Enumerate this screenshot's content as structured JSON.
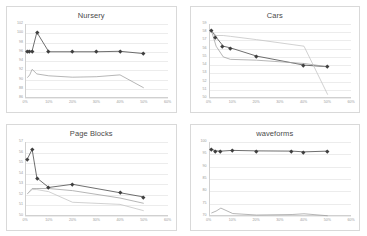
{
  "figure": {
    "layout": "2x2-grid",
    "background": "#ffffff",
    "panel_border_color": "#d9d9d9",
    "gridline_color": "#ececec",
    "tick_label_color": "#9a9a9a",
    "title_color": "#4a4a4a"
  },
  "chart_data": [
    {
      "type": "line",
      "title": "Nursery",
      "xlabel": "",
      "ylabel": "",
      "grid": true,
      "legend": "none",
      "xlim": [
        0,
        60
      ],
      "ylim": [
        86,
        102
      ],
      "yticks": [
        86,
        88,
        90,
        92,
        94,
        96,
        98,
        100,
        102
      ],
      "ytick_labels": [
        "86",
        "88",
        "90",
        "92",
        "94",
        "96",
        "98",
        "100",
        "102"
      ],
      "xticks": [
        0,
        10,
        20,
        30,
        40,
        50,
        60
      ],
      "xtick_labels": [
        "0%",
        "10%",
        "20%",
        "30%",
        "40%",
        "50%",
        "60%"
      ],
      "series": [
        {
          "name": "series-1-dark-markers",
          "color": "#3f3f3f",
          "marker": "diamond",
          "x": [
            1,
            2,
            3,
            5,
            10,
            20,
            30,
            40,
            50
          ],
          "values": [
            96.1,
            96.1,
            96.2,
            100.2,
            96.0,
            96.0,
            96.0,
            96.1,
            95.6
          ]
        },
        {
          "name": "series-2-gray",
          "color": "#9e9e9e",
          "marker": "none",
          "x": [
            1,
            2,
            3,
            5,
            10,
            20,
            30,
            40,
            50
          ],
          "values": [
            90.4,
            91.0,
            92.2,
            91.2,
            90.8,
            90.5,
            90.6,
            91.0,
            88.2
          ]
        }
      ]
    },
    {
      "type": "line",
      "title": "Cars",
      "xlabel": "",
      "ylabel": "",
      "grid": true,
      "legend": "none",
      "xlim": [
        0,
        60
      ],
      "ylim": [
        50,
        59
      ],
      "yticks": [
        50,
        51,
        52,
        53,
        54,
        55,
        56,
        57,
        58,
        59
      ],
      "ytick_labels": [
        "50",
        "51",
        "52",
        "53",
        "54",
        "55",
        "56",
        "57",
        "58",
        "59"
      ],
      "xticks": [
        0,
        10,
        20,
        30,
        40,
        50,
        60
      ],
      "xtick_labels": [
        "0%",
        "10%",
        "20%",
        "30%",
        "40%",
        "50%",
        "60%"
      ],
      "series": [
        {
          "name": "series-1-dark-markers",
          "color": "#3f3f3f",
          "marker": "diamond",
          "x": [
            1,
            3,
            6,
            9,
            20,
            40,
            50
          ],
          "values": [
            58.2,
            57.4,
            56.3,
            56.1,
            55.1,
            54.0,
            53.8
          ]
        },
        {
          "name": "series-2-gray",
          "color": "#9e9e9e",
          "marker": "none",
          "x": [
            1,
            3,
            6,
            9,
            20,
            40,
            50
          ],
          "values": [
            58.2,
            56.3,
            55.0,
            54.7,
            54.6,
            54.2,
            53.8
          ]
        },
        {
          "name": "series-3-light-gray",
          "color": "#c2c2c2",
          "marker": "none",
          "x": [
            1,
            3,
            6,
            9,
            20,
            40,
            50
          ],
          "values": [
            58.2,
            57.6,
            57.6,
            57.5,
            57.1,
            56.3,
            50.4
          ]
        }
      ]
    },
    {
      "type": "line",
      "title": "Page Blocks",
      "xlabel": "",
      "ylabel": "",
      "grid": true,
      "legend": "none",
      "xlim": [
        0,
        60
      ],
      "ylim": [
        50,
        57
      ],
      "yticks": [
        50,
        51,
        52,
        53,
        54,
        55,
        56,
        57
      ],
      "ytick_labels": [
        "50",
        "51",
        "52",
        "53",
        "54",
        "55",
        "56",
        "57"
      ],
      "xticks": [
        0,
        10,
        20,
        30,
        40,
        50,
        60
      ],
      "xtick_labels": [
        "0%",
        "10%",
        "20%",
        "30%",
        "40%",
        "50%",
        "60%"
      ],
      "series": [
        {
          "name": "series-1-dark-markers",
          "color": "#3f3f3f",
          "marker": "diamond",
          "x": [
            1,
            3,
            5,
            10,
            20,
            40,
            50
          ],
          "values": [
            55.4,
            56.3,
            53.6,
            52.7,
            53.0,
            52.2,
            51.8
          ]
        },
        {
          "name": "series-2-gray",
          "color": "#9e9e9e",
          "marker": "none",
          "x": [
            1,
            3,
            5,
            10,
            20,
            40,
            50
          ],
          "values": [
            52.1,
            52.6,
            52.6,
            52.6,
            52.4,
            51.7,
            51.2
          ]
        },
        {
          "name": "series-3-light-gray",
          "color": "#c2c2c2",
          "marker": "none",
          "x": [
            1,
            3,
            5,
            10,
            20,
            40,
            50
          ],
          "values": [
            52.1,
            52.5,
            52.5,
            52.3,
            51.3,
            51.1,
            50.5
          ]
        }
      ]
    },
    {
      "type": "line",
      "title": "waveforms",
      "xlabel": "",
      "ylabel": "",
      "grid": true,
      "legend": "none",
      "xlim": [
        0,
        60
      ],
      "ylim": [
        70,
        100
      ],
      "yticks": [
        70,
        75,
        80,
        85,
        90,
        95,
        100
      ],
      "ytick_labels": [
        "70",
        "75",
        "80",
        "85",
        "90",
        "95",
        "100"
      ],
      "xticks": [
        0,
        10,
        20,
        30,
        40,
        50,
        60
      ],
      "xtick_labels": [
        "0%",
        "10%",
        "20%",
        "30%",
        "40%",
        "50%",
        "60%"
      ],
      "series": [
        {
          "name": "series-1-dark-markers",
          "color": "#3f3f3f",
          "marker": "diamond",
          "x": [
            1,
            3,
            5,
            10,
            20,
            35,
            40,
            50
          ],
          "values": [
            97.0,
            96.4,
            96.3,
            96.6,
            96.4,
            96.3,
            96.0,
            96.3
          ]
        },
        {
          "name": "series-2-gray",
          "color": "#9e9e9e",
          "marker": "none",
          "x": [
            1,
            3,
            5,
            10,
            20,
            35,
            40,
            50
          ],
          "values": [
            71.2,
            72.0,
            73.2,
            71.0,
            70.4,
            70.6,
            70.9,
            70.1
          ]
        }
      ]
    }
  ]
}
